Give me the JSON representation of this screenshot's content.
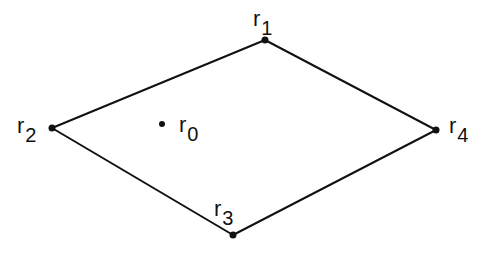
{
  "diagram": {
    "type": "quadrilateral-with-interior-point",
    "colors": {
      "stroke": "#111111",
      "background": "#ffffff"
    },
    "vertices": [
      {
        "id": "r1",
        "base": "r",
        "sub": "1",
        "x": 265,
        "y": 40
      },
      {
        "id": "r2",
        "base": "r",
        "sub": "2",
        "x": 52,
        "y": 128
      },
      {
        "id": "r3",
        "base": "r",
        "sub": "3",
        "x": 233,
        "y": 235
      },
      {
        "id": "r4",
        "base": "r",
        "sub": "4",
        "x": 436,
        "y": 130
      }
    ],
    "interior_point": {
      "id": "r0",
      "base": "r",
      "sub": "0",
      "x": 162,
      "y": 124
    },
    "edges": [
      [
        "r1",
        "r2"
      ],
      [
        "r2",
        "r3"
      ],
      [
        "r3",
        "r4"
      ],
      [
        "r4",
        "r1"
      ]
    ]
  }
}
